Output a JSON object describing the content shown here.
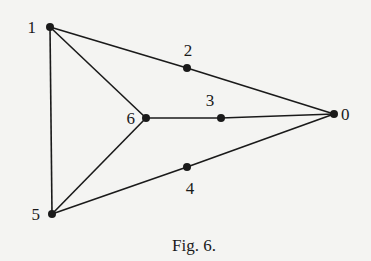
{
  "diagram": {
    "caption": "Fig. 6.",
    "nodes": [
      {
        "id": "0",
        "label": "0",
        "x": 334,
        "y": 114,
        "lx": 341,
        "ly": 120,
        "anchor": "start"
      },
      {
        "id": "1",
        "label": "1",
        "x": 50,
        "y": 27,
        "lx": 36,
        "ly": 33,
        "anchor": "end"
      },
      {
        "id": "2",
        "label": "2",
        "x": 187,
        "y": 68,
        "lx": 188,
        "ly": 56,
        "anchor": "middle"
      },
      {
        "id": "3",
        "label": "3",
        "x": 221,
        "y": 118,
        "lx": 210,
        "ly": 106,
        "anchor": "middle"
      },
      {
        "id": "4",
        "label": "4",
        "x": 187,
        "y": 167,
        "lx": 190,
        "ly": 194,
        "anchor": "middle"
      },
      {
        "id": "5",
        "label": "5",
        "x": 52,
        "y": 214,
        "lx": 40,
        "ly": 220,
        "anchor": "end"
      },
      {
        "id": "6",
        "label": "6",
        "x": 146,
        "y": 118,
        "lx": 135,
        "ly": 124,
        "anchor": "end"
      }
    ],
    "edges": [
      [
        "1",
        "2"
      ],
      [
        "2",
        "0"
      ],
      [
        "1",
        "6"
      ],
      [
        "1",
        "5"
      ],
      [
        "6",
        "3"
      ],
      [
        "3",
        "0"
      ],
      [
        "6",
        "5"
      ],
      [
        "5",
        "4"
      ],
      [
        "4",
        "0"
      ]
    ]
  }
}
